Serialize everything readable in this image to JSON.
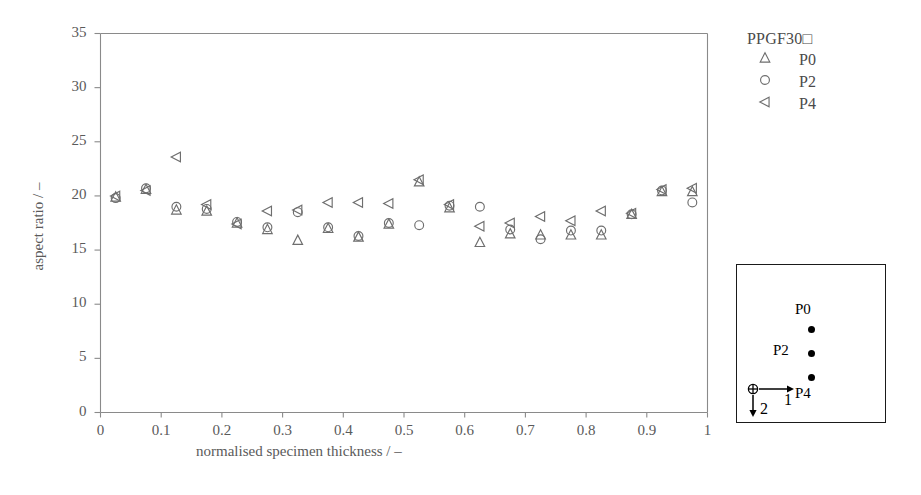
{
  "chart_data": {
    "type": "scatter",
    "title": "",
    "xlabel": "normalised specimen thickness / –",
    "ylabel": "aspect ratio / –",
    "xlim": [
      0,
      1
    ],
    "ylim": [
      0,
      35
    ],
    "xticks": [
      "0",
      "0.1",
      "0.2",
      "0.3",
      "0.4",
      "0.5",
      "0.6",
      "0.7",
      "0.8",
      "0.9",
      "1"
    ],
    "xtick_values": [
      0,
      0.1,
      0.2,
      0.3,
      0.4,
      0.5,
      0.6,
      0.7,
      0.8,
      0.9,
      1
    ],
    "yticks": [
      "0",
      "5",
      "10",
      "15",
      "20",
      "25",
      "30",
      "35"
    ],
    "ytick_values": [
      0,
      5,
      10,
      15,
      20,
      25,
      30,
      35
    ],
    "grid": false,
    "legend_position": "outside-right-top",
    "x": [
      0.025,
      0.075,
      0.125,
      0.175,
      0.225,
      0.275,
      0.325,
      0.375,
      0.425,
      0.475,
      0.525,
      0.575,
      0.625,
      0.675,
      0.725,
      0.775,
      0.825,
      0.875,
      0.925,
      0.975
    ],
    "series": [
      {
        "name": "P0",
        "marker": "triangle-up",
        "color": "#6e6e6e",
        "values": [
          19.9,
          20.6,
          18.7,
          18.6,
          17.5,
          16.9,
          15.9,
          17.0,
          16.2,
          17.4,
          21.3,
          18.9,
          15.7,
          16.5,
          16.4,
          16.4,
          16.4,
          18.3,
          20.4,
          20.4
        ]
      },
      {
        "name": "P2",
        "marker": "circle",
        "color": "#6e6e6e",
        "values": [
          19.8,
          20.7,
          19.0,
          18.8,
          17.6,
          17.1,
          18.5,
          17.1,
          16.3,
          17.5,
          17.3,
          19.1,
          19.0,
          16.9,
          16.0,
          16.8,
          16.8,
          18.3,
          20.5,
          19.4
        ]
      },
      {
        "name": "P4",
        "marker": "triangle-left",
        "color": "#6e6e6e",
        "values": [
          20.0,
          20.5,
          23.6,
          19.2,
          17.4,
          18.6,
          18.7,
          19.4,
          19.4,
          19.3,
          21.5,
          19.2,
          17.2,
          17.5,
          18.1,
          17.7,
          18.6,
          18.4,
          20.6,
          20.7
        ]
      }
    ]
  },
  "legend": {
    "title": "PPGF30□",
    "entries": [
      {
        "symbol": "triangle-up",
        "label": "P0"
      },
      {
        "symbol": "circle",
        "label": "P2"
      },
      {
        "symbol": "triangle-left",
        "label": "P4"
      }
    ]
  },
  "inset": {
    "points": [
      {
        "label": "P0",
        "label_pos": "above"
      },
      {
        "label": "P2",
        "label_pos": "left"
      },
      {
        "label": "P4",
        "label_pos": "below"
      }
    ],
    "axis_1_label": "1",
    "axis_2_label": "2",
    "origin_marker": "circled-cross"
  },
  "colors": {
    "marker": "#6e6e6e",
    "axis": "#8a8a8a",
    "text": "#4a4a4a",
    "inset_border": "#1a1a1a",
    "inset_point": "#000000",
    "background": "#ffffff"
  }
}
